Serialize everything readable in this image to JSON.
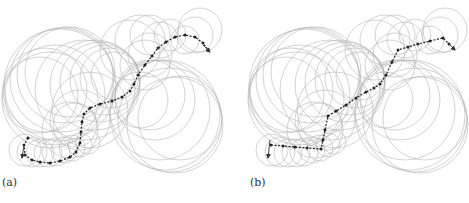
{
  "figure": {
    "panels": [
      {
        "label": "(a)",
        "label_pos": [
          2,
          176
        ],
        "circle_color": "#b5b5b5",
        "path_color": "#222222",
        "circles": [
          [
            60,
            85,
            56
          ],
          [
            62,
            80,
            52
          ],
          [
            65,
            75,
            48
          ],
          [
            70,
            72,
            45
          ],
          [
            55,
            95,
            50
          ],
          [
            50,
            100,
            48
          ],
          [
            45,
            90,
            42
          ],
          [
            40,
            95,
            38
          ],
          [
            85,
            90,
            50
          ],
          [
            95,
            85,
            45
          ],
          [
            100,
            82,
            40
          ],
          [
            105,
            80,
            35
          ],
          [
            110,
            78,
            30
          ],
          [
            115,
            76,
            24
          ],
          [
            90,
            110,
            38
          ],
          [
            80,
            120,
            30
          ],
          [
            70,
            130,
            28
          ],
          [
            75,
            125,
            22
          ],
          [
            130,
            50,
            30
          ],
          [
            140,
            40,
            25
          ],
          [
            150,
            35,
            20
          ],
          [
            160,
            40,
            18
          ],
          [
            170,
            35,
            16
          ],
          [
            150,
            55,
            22
          ],
          [
            145,
            65,
            25
          ],
          [
            200,
            30,
            22
          ],
          [
            195,
            35,
            18
          ],
          [
            185,
            40,
            14
          ],
          [
            160,
            110,
            50
          ],
          [
            165,
            115,
            55
          ],
          [
            170,
            120,
            52
          ],
          [
            175,
            125,
            48
          ],
          [
            180,
            118,
            42
          ],
          [
            155,
            100,
            40
          ],
          [
            150,
            95,
            35
          ],
          [
            140,
            100,
            28
          ],
          [
            25,
            150,
            16
          ],
          [
            32,
            152,
            15
          ],
          [
            40,
            153,
            14
          ],
          [
            48,
            153,
            14
          ],
          [
            56,
            152,
            14
          ],
          [
            64,
            150,
            13
          ],
          [
            72,
            148,
            13
          ],
          [
            80,
            145,
            12
          ],
          [
            88,
            142,
            12
          ]
        ],
        "path": [
          [
            28,
            138
          ],
          [
            24,
            145
          ],
          [
            25,
            155
          ],
          [
            32,
            160
          ],
          [
            40,
            162
          ],
          [
            50,
            163
          ],
          [
            60,
            161
          ],
          [
            70,
            157
          ],
          [
            76,
            152
          ],
          [
            80,
            143
          ],
          [
            81,
            132
          ],
          [
            82,
            122
          ],
          [
            84,
            114
          ],
          [
            90,
            108
          ],
          [
            100,
            104
          ],
          [
            112,
            101
          ],
          [
            122,
            97
          ],
          [
            130,
            91
          ],
          [
            134,
            84
          ],
          [
            138,
            75
          ],
          [
            145,
            65
          ],
          [
            152,
            56
          ],
          [
            158,
            48
          ],
          [
            166,
            42
          ],
          [
            175,
            37
          ],
          [
            185,
            35
          ],
          [
            195,
            37
          ],
          [
            203,
            43
          ],
          [
            208,
            50
          ]
        ],
        "start_arrow": {
          "from": [
            24,
            145
          ],
          "to": [
            22,
            158
          ]
        },
        "end_arrow": {
          "from": [
            203,
            45
          ],
          "to": [
            210,
            52
          ]
        }
      },
      {
        "label": "(b)",
        "label_pos": [
          250,
          176
        ],
        "circle_color": "#b5b5b5",
        "path_color": "#222222",
        "circles": [
          [
            305,
            85,
            56
          ],
          [
            308,
            80,
            52
          ],
          [
            311,
            75,
            48
          ],
          [
            316,
            72,
            45
          ],
          [
            300,
            95,
            50
          ],
          [
            296,
            100,
            48
          ],
          [
            291,
            90,
            42
          ],
          [
            286,
            95,
            38
          ],
          [
            330,
            90,
            50
          ],
          [
            340,
            85,
            45
          ],
          [
            345,
            82,
            40
          ],
          [
            350,
            80,
            35
          ],
          [
            355,
            78,
            30
          ],
          [
            360,
            76,
            24
          ],
          [
            335,
            110,
            38
          ],
          [
            325,
            120,
            30
          ],
          [
            315,
            130,
            28
          ],
          [
            320,
            125,
            22
          ],
          [
            375,
            50,
            30
          ],
          [
            385,
            40,
            25
          ],
          [
            395,
            35,
            20
          ],
          [
            405,
            40,
            18
          ],
          [
            415,
            35,
            16
          ],
          [
            395,
            55,
            22
          ],
          [
            390,
            65,
            25
          ],
          [
            445,
            30,
            22
          ],
          [
            440,
            35,
            18
          ],
          [
            430,
            40,
            14
          ],
          [
            405,
            110,
            50
          ],
          [
            410,
            115,
            55
          ],
          [
            415,
            120,
            52
          ],
          [
            420,
            125,
            48
          ],
          [
            425,
            118,
            42
          ],
          [
            400,
            100,
            40
          ],
          [
            395,
            95,
            35
          ],
          [
            385,
            100,
            28
          ],
          [
            272,
            150,
            16
          ],
          [
            280,
            152,
            15
          ],
          [
            288,
            153,
            14
          ],
          [
            296,
            153,
            14
          ],
          [
            304,
            152,
            14
          ],
          [
            312,
            150,
            13
          ],
          [
            320,
            148,
            13
          ],
          [
            328,
            145,
            12
          ],
          [
            334,
            142,
            12
          ]
        ],
        "path": [
          [
            271,
            145
          ],
          [
            283,
            146
          ],
          [
            295,
            147
          ],
          [
            307,
            148
          ],
          [
            321,
            149
          ],
          [
            323,
            140
          ],
          [
            325,
            130
          ],
          [
            328,
            116
          ],
          [
            336,
            111
          ],
          [
            346,
            105
          ],
          [
            356,
            98
          ],
          [
            366,
            92
          ],
          [
            374,
            88
          ],
          [
            380,
            84
          ],
          [
            386,
            75
          ],
          [
            392,
            62
          ],
          [
            398,
            50
          ],
          [
            408,
            47
          ],
          [
            418,
            44
          ],
          [
            430,
            41
          ],
          [
            443,
            38
          ],
          [
            449,
            44
          ]
        ],
        "start_arrow": {
          "from": [
            270,
            140
          ],
          "to": [
            268,
            158
          ]
        },
        "end_arrow": {
          "from": [
            449,
            44
          ],
          "to": [
            455,
            50
          ]
        }
      }
    ]
  }
}
